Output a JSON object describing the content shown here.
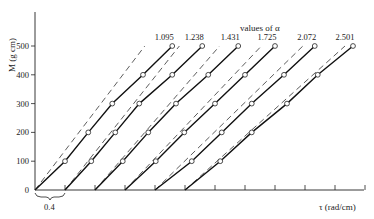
{
  "chart_data": {
    "type": "line",
    "title": "",
    "xlabel": "τ (rad/cm)",
    "ylabel": "M (g cm)",
    "legend_title": "values of α",
    "y_ticks": [
      0,
      100,
      200,
      300,
      400,
      500
    ],
    "ylim": [
      0,
      600
    ],
    "x_tick_spacing": 0.4,
    "x_tick_count": 11,
    "xlim": [
      0,
      4.4
    ],
    "offset_annotation": "0.4",
    "offset_note": "Each successive curve is shifted right by 0.4 rad/cm",
    "grid": false,
    "series": [
      {
        "name": "1.095",
        "offset": 0.0,
        "solid_start": 0.0,
        "dashed_slope_factor": 1.25,
        "points": [
          {
            "M": 0,
            "tau": 0.0
          },
          {
            "M": 100,
            "tau": 0.4
          },
          {
            "M": 200,
            "tau": 0.71
          },
          {
            "M": 300,
            "tau": 1.03
          },
          {
            "M": 400,
            "tau": 1.44
          },
          {
            "M": 500,
            "tau": 1.83
          }
        ]
      },
      {
        "name": "1.238",
        "offset": 0.4,
        "solid_start": 0.4,
        "dashed_slope_factor": 1.2,
        "points": [
          {
            "M": 0,
            "tau": 0.4
          },
          {
            "M": 100,
            "tau": 0.75
          },
          {
            "M": 200,
            "tau": 1.07
          },
          {
            "M": 300,
            "tau": 1.39
          },
          {
            "M": 400,
            "tau": 1.83
          },
          {
            "M": 500,
            "tau": 2.23
          }
        ]
      },
      {
        "name": "1.431",
        "offset": 0.8,
        "solid_start": 0.8,
        "dashed_slope_factor": 1.15,
        "points": [
          {
            "M": 0,
            "tau": 0.8
          },
          {
            "M": 100,
            "tau": 1.17
          },
          {
            "M": 200,
            "tau": 1.51
          },
          {
            "M": 300,
            "tau": 1.88
          },
          {
            "M": 400,
            "tau": 2.31
          },
          {
            "M": 500,
            "tau": 2.71
          }
        ]
      },
      {
        "name": "1.725",
        "offset": 1.2,
        "solid_start": 1.2,
        "dashed_slope_factor": 1.1,
        "points": [
          {
            "M": 0,
            "tau": 1.2
          },
          {
            "M": 100,
            "tau": 1.61
          },
          {
            "M": 200,
            "tau": 1.99
          },
          {
            "M": 300,
            "tau": 2.4
          },
          {
            "M": 400,
            "tau": 2.8
          },
          {
            "M": 500,
            "tau": 3.2
          }
        ]
      },
      {
        "name": "2.072",
        "offset": 1.6,
        "solid_start": 1.6,
        "dashed_slope_factor": 1.08,
        "points": [
          {
            "M": 0,
            "tau": 1.6
          },
          {
            "M": 100,
            "tau": 2.09
          },
          {
            "M": 200,
            "tau": 2.49
          },
          {
            "M": 300,
            "tau": 2.89
          },
          {
            "M": 400,
            "tau": 3.32
          },
          {
            "M": 500,
            "tau": 3.73
          }
        ]
      },
      {
        "name": "2.501",
        "offset": 2.0,
        "solid_start": 2.0,
        "dashed_slope_factor": 1.05,
        "points": [
          {
            "M": 0,
            "tau": 2.0
          },
          {
            "M": 100,
            "tau": 2.47
          },
          {
            "M": 200,
            "tau": 2.89
          },
          {
            "M": 300,
            "tau": 3.36
          },
          {
            "M": 400,
            "tau": 3.77
          },
          {
            "M": 500,
            "tau": 4.24
          }
        ]
      }
    ]
  },
  "layout": {
    "origin_x": 35,
    "origin_y": 190,
    "px_per_tau": 75,
    "px_per_M": 0.288,
    "y_axis_top": 12,
    "x_axis_right": 364
  }
}
